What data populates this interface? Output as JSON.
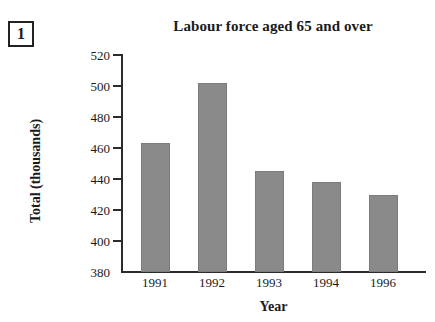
{
  "question_number": "1",
  "chart_data": {
    "type": "bar",
    "title": "Labour force aged 65 and over",
    "xlabel": "Year",
    "ylabel": "Total (thousands)",
    "categories": [
      "1991",
      "1992",
      "1993",
      "1994",
      "1996"
    ],
    "values": [
      463,
      502,
      445,
      438,
      430
    ],
    "ylim": [
      380,
      520
    ],
    "yticks": [
      380,
      400,
      420,
      440,
      460,
      480,
      500,
      520
    ],
    "ytick_labels": [
      "380",
      "400",
      "420",
      "440",
      "460",
      "480",
      "500",
      "520"
    ],
    "grid": false,
    "legend": false,
    "bar_color": "#8a8a8a",
    "axis_color": "#2b2b2b"
  }
}
